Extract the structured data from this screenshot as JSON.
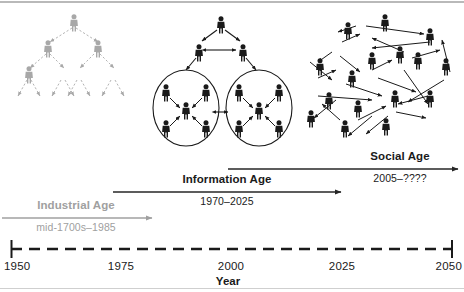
{
  "figure": {
    "title_axis": "Year",
    "eras": [
      {
        "id": "industrial",
        "name": "Industrial Age",
        "years": "mid-1700s–1985",
        "color": "#a0a0a0",
        "arrow_x1": 2,
        "arrow_x2": 152,
        "arrow_y": 218,
        "name_x": 76,
        "name_y": 206,
        "years_x": 76,
        "years_y": 228
      },
      {
        "id": "information",
        "name": "Information Age",
        "years": "1970–2025",
        "color": "#262626",
        "arrow_x1": 113,
        "arrow_x2": 341,
        "arrow_y": 192,
        "name_x": 227,
        "name_y": 180,
        "years_x": 227,
        "years_y": 202
      },
      {
        "id": "social",
        "name": "Social Age",
        "years": "2005–????",
        "color": "#262626",
        "arrow_x1": 228,
        "arrow_x2": 458,
        "arrow_y": 169,
        "name_x": 400,
        "name_y": 157,
        "years_x": 400,
        "years_y": 179
      }
    ],
    "axis": {
      "y": 249,
      "x_start": 11,
      "x_end": 452,
      "style": "dashed",
      "ticks": [
        {
          "label": "1950",
          "x": 11
        },
        {
          "label": "1975",
          "x": 121
        },
        {
          "label": "2000",
          "x": 231
        },
        {
          "label": "2025",
          "x": 342
        },
        {
          "label": "2050",
          "x": 452
        }
      ]
    },
    "illustrations": [
      {
        "id": "hierarchy",
        "caption_role": "Industrial Age network topology",
        "style": "hierarchical-tree",
        "color": "#a8a8a8",
        "link_style": "dashed",
        "levels": [
          1,
          2,
          4,
          8
        ]
      },
      {
        "id": "hybrid-clusters",
        "caption_role": "Information Age network topology",
        "style": "hierarchy-with-clusters",
        "color": "#1a1a1a",
        "link_style": "solid-arrows",
        "levels": [
          1,
          2
        ],
        "clusters": 2,
        "cluster_size": 5
      },
      {
        "id": "mesh",
        "caption_role": "Social Age network topology",
        "style": "mesh-network",
        "color": "#1a1a1a",
        "link_style": "solid-arrows",
        "nodes": 16
      }
    ]
  }
}
